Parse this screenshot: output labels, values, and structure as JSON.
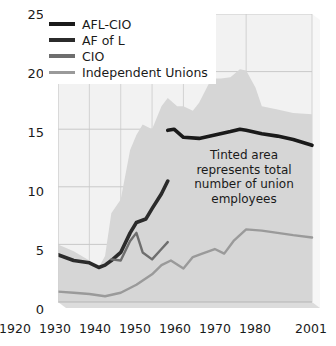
{
  "chart_data": {
    "type": "area",
    "title": "",
    "xlabel": "",
    "ylabel": "",
    "xlim": [
      1920,
      2001
    ],
    "ylim": [
      0,
      25
    ],
    "grid": true,
    "legend_position": "top-left",
    "annotations": [
      {
        "id": "tinted-area-note",
        "text": "Tinted area represents total number of union employees",
        "lines": [
          "Tinted area",
          "represents total",
          "number of union",
          "employees"
        ]
      }
    ],
    "y_ticks": [
      0,
      5,
      10,
      15,
      20,
      25
    ],
    "x_ticks": [
      1920,
      1930,
      1940,
      1950,
      1960,
      1970,
      1980,
      2001
    ],
    "x_tick_labels": [
      "1920",
      "1930",
      "1940",
      "1950",
      "1960",
      "1970",
      "1980",
      "2001"
    ],
    "colors": {
      "afl_cio": "#1a1a1a",
      "af_of_l": "#2b2b2b",
      "cio": "#6e6e6e",
      "independent_unions": "#9a9a9a",
      "tinted_area": "#d6d6d6",
      "plot_background": "#f2f2f2",
      "gridline": "#c9c9c9",
      "base_slab": "#cfcfcf"
    },
    "series": [
      {
        "name": "AFL-CIO",
        "key": "afl_cio",
        "color": "#1a1a1a",
        "x": [
          1955,
          1957,
          1960,
          1965,
          1970,
          1975,
          1978,
          1980,
          1985,
          1990,
          1995,
          2001
        ],
        "values": [
          14.9,
          15.0,
          14.3,
          14.2,
          14.5,
          14.8,
          15.0,
          14.9,
          14.6,
          14.4,
          14.1,
          13.6
        ]
      },
      {
        "name": "AF of L",
        "key": "af_of_l",
        "color": "#2b2b2b",
        "x": [
          1920,
          1925,
          1930,
          1933,
          1935,
          1937,
          1940,
          1943,
          1945,
          1948,
          1950,
          1953,
          1955
        ],
        "values": [
          4.1,
          3.6,
          3.4,
          3.0,
          3.2,
          3.6,
          4.3,
          6.0,
          6.9,
          7.2,
          8.1,
          9.4,
          10.5
        ]
      },
      {
        "name": "CIO",
        "key": "cio",
        "color": "#6e6e6e",
        "x": [
          1937,
          1940,
          1943,
          1945,
          1947,
          1950,
          1953,
          1955
        ],
        "values": [
          3.7,
          3.6,
          5.3,
          6.0,
          4.3,
          3.7,
          4.6,
          5.2
        ]
      },
      {
        "name": "Independent Unions",
        "key": "independent_unions",
        "color": "#9a9a9a",
        "x": [
          1920,
          1925,
          1930,
          1935,
          1940,
          1945,
          1950,
          1953,
          1956,
          1960,
          1963,
          1966,
          1970,
          1973,
          1976,
          1980,
          1985,
          1990,
          1995,
          2001
        ],
        "values": [
          0.9,
          0.8,
          0.7,
          0.5,
          0.8,
          1.5,
          2.4,
          3.2,
          3.6,
          2.9,
          3.9,
          4.2,
          4.6,
          4.2,
          5.3,
          6.3,
          6.2,
          6.0,
          5.8,
          5.6
        ]
      }
    ],
    "tinted_area": {
      "name": "Total number of union employees",
      "color": "#d6d6d6",
      "x": [
        1920,
        1925,
        1930,
        1933,
        1935,
        1937,
        1940,
        1943,
        1945,
        1947,
        1950,
        1953,
        1955,
        1958,
        1960,
        1963,
        1965,
        1968,
        1970,
        1972,
        1975,
        1978,
        1980,
        1983,
        1985,
        1990,
        1995,
        2001
      ],
      "values": [
        5.0,
        4.4,
        3.6,
        3.0,
        4.0,
        7.7,
        8.9,
        13.2,
        14.5,
        15.4,
        15.0,
        17.0,
        17.7,
        17.0,
        17.0,
        16.6,
        17.3,
        18.9,
        19.4,
        19.4,
        19.5,
        20.2,
        20.1,
        18.6,
        17.0,
        16.7,
        16.4,
        16.3
      ]
    }
  },
  "legend": {
    "items": [
      {
        "label": "AFL-CIO",
        "color": "#1a1a1a",
        "thickness": 4
      },
      {
        "label": "AF of L",
        "color": "#2b2b2b",
        "thickness": 4
      },
      {
        "label": "CIO",
        "color": "#6e6e6e",
        "thickness": 4
      },
      {
        "label": "Independent Unions",
        "color": "#9a9a9a",
        "thickness": 3
      }
    ]
  },
  "axes": {
    "y_labels": [
      "25",
      "20",
      "15",
      "10",
      "5",
      "0"
    ],
    "x_labels": [
      "1920",
      "1930",
      "1940",
      "1950",
      "1960",
      "1970",
      "1980",
      "2001"
    ]
  }
}
